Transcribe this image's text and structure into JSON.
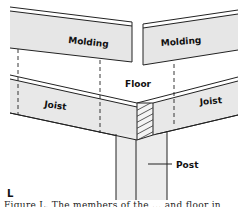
{
  "diagram": {
    "labels": {
      "molding_left": "Molding",
      "molding_right": "Molding",
      "floor": "Floor",
      "joist_left": "Joist",
      "joist_right": "Joist",
      "post": "Post"
    },
    "panel_letter": "L",
    "caption_partial": "Figure L. The members of the ... and floor in"
  },
  "colors": {
    "fill": "#e8e8e8",
    "stroke": "#222222",
    "background": "#ffffff"
  }
}
